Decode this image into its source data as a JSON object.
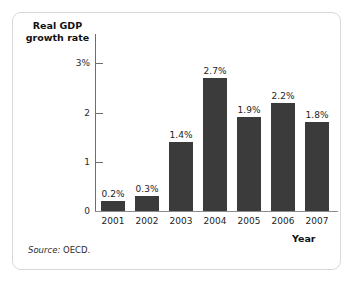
{
  "figure": {
    "source_prefix": "Source:",
    "source_value": "OECD.",
    "frame_color": "#d8d8d8",
    "background": "#ffffff"
  },
  "chart_data": {
    "type": "bar",
    "title": "",
    "ylabel": "Real GDP growth rate",
    "ylabel_line1": "Real GDP",
    "ylabel_line2": "growth rate",
    "xlabel": "Year",
    "categories": [
      "2001",
      "2002",
      "2003",
      "2004",
      "2005",
      "2006",
      "2007"
    ],
    "values": [
      0.2,
      0.3,
      1.4,
      2.7,
      1.9,
      2.2,
      1.8
    ],
    "data_labels": [
      "0.2%",
      "0.3%",
      "1.4%",
      "2.7%",
      "1.9%",
      "2.2%",
      "1.8%"
    ],
    "ylim": [
      0,
      3
    ],
    "yticks": [
      0,
      1,
      2,
      3
    ],
    "ytick_labels": [
      "0",
      "1",
      "2",
      "3%"
    ],
    "grid": false,
    "legend": false,
    "bar_color": "#3b3b3b",
    "axis_color": "#6e6e6e"
  }
}
